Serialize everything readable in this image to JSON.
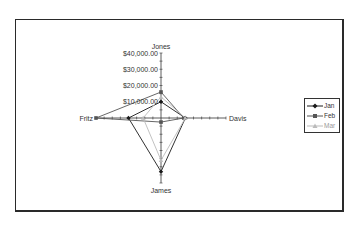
{
  "chart_data": {
    "type": "radar",
    "title": "",
    "categories": [
      "Jones",
      "Davis",
      "James",
      "Fritz"
    ],
    "axis": {
      "ticks": [
        "$10,000.00",
        "$20,000.00",
        "$30,000.00",
        "$40,000.00"
      ],
      "tick_values": [
        10000,
        20000,
        30000,
        40000
      ],
      "range": [
        0,
        40000
      ]
    },
    "series": [
      {
        "name": "Jan",
        "color": "#1a1a1a",
        "marker": "diamond",
        "values": [
          10000,
          15000,
          33000,
          20000
        ]
      },
      {
        "name": "Feb",
        "color": "#555555",
        "marker": "square",
        "values": [
          16000,
          14000,
          2500,
          40000
        ]
      },
      {
        "name": "Mar",
        "color": "#bbbbbb",
        "marker": "triangle",
        "values": [
          13000,
          15000,
          26000,
          11000
        ]
      }
    ],
    "legend_position": "right",
    "grid": false
  },
  "legend": {
    "items": [
      {
        "label": "Jan"
      },
      {
        "label": "Feb"
      },
      {
        "label": "Mar"
      }
    ]
  }
}
